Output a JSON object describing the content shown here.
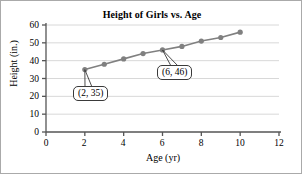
{
  "chart_data": {
    "type": "line",
    "title": "Height of Girls vs. Age",
    "xlabel": "Age (yr)",
    "ylabel": "Height (in.)",
    "xlim": [
      0,
      12
    ],
    "ylim": [
      0,
      60
    ],
    "xticks": [
      "0",
      "2",
      "4",
      "6",
      "8",
      "10",
      "12"
    ],
    "yticks": [
      "0",
      "10",
      "20",
      "30",
      "40",
      "50",
      "60"
    ],
    "grid": "horizontal",
    "legend": "none",
    "series": [
      {
        "name": "Height of girls",
        "marker": "circle",
        "color": "#808080",
        "x": [
          2,
          3,
          4,
          5,
          6,
          7,
          8,
          9,
          10
        ],
        "values": [
          35,
          38,
          41,
          44,
          46,
          48,
          51,
          53,
          56
        ]
      }
    ],
    "annotations": [
      {
        "label": "(2, 35)",
        "point_x": 2,
        "point_y": 35
      },
      {
        "label": "(6, 46)",
        "point_x": 6,
        "point_y": 46
      }
    ]
  },
  "axis_color": "#555555",
  "grid_color": "#d8d8d8"
}
